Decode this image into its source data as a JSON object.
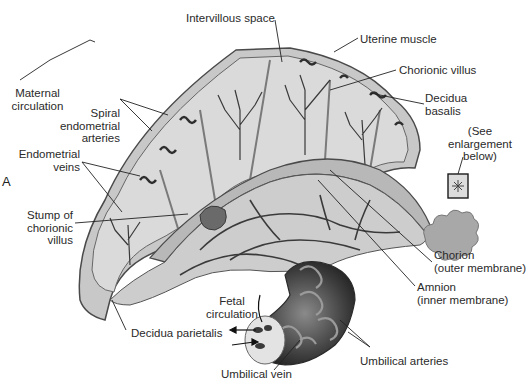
{
  "figure": {
    "panel_letter": "A",
    "labels": {
      "intervillous_space": "Intervillous space",
      "uterine_muscle": "Uterine muscle",
      "chorionic_villus": "Chorionic villus",
      "decidua_basalis_1": "Decidua",
      "decidua_basalis_2": "basalis",
      "maternal_circulation_1": "Maternal",
      "maternal_circulation_2": "circulation",
      "spiral_arteries_1": "Spiral",
      "spiral_arteries_2": "endometrial",
      "spiral_arteries_3": "arteries",
      "endometrial_veins_1": "Endometrial",
      "endometrial_veins_2": "veins",
      "see_enlargement_1": "(See",
      "see_enlargement_2": "enlargement",
      "see_enlargement_3": "below)",
      "stump_1": "Stump of",
      "stump_2": "chorionic",
      "stump_3": "villus",
      "chorion_1": "Chorion",
      "chorion_2": "(outer membrane)",
      "amnion_1": "Amnion",
      "amnion_2": "(inner membrane)",
      "fetal_circulation_1": "Fetal",
      "fetal_circulation_2": "circulation",
      "decidua_parietalis": "Decidua parietalis",
      "umbilical_arteries": "Umbilical arteries",
      "umbilical_vein": "Umbilical vein"
    },
    "colors": {
      "tissue_light": "#d6d6d6",
      "tissue_mid": "#b0b0b0",
      "vessel_dark": "#3a3a3a",
      "outline": "#555555",
      "leader_line": "#222222"
    }
  }
}
